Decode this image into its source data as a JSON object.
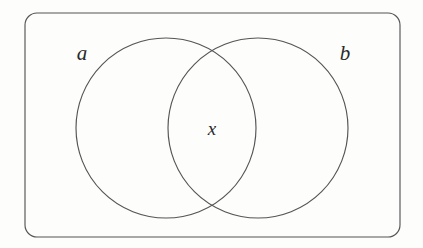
{
  "diagram": {
    "type": "venn-diagram",
    "title": "",
    "universe": {
      "name": "universal-set-rectangle",
      "label": "",
      "x": 25,
      "y": 13,
      "width": 375,
      "height": 224,
      "corner_radius": 12,
      "stroke_color": "#555555",
      "fill_color": "none"
    },
    "sets": [
      {
        "id": "a",
        "label": "a",
        "label_x": 82,
        "label_y": 60,
        "center_x": 166,
        "center_y": 128,
        "radius": 90,
        "stroke_color": "#555555",
        "fill_color": "none"
      },
      {
        "id": "b",
        "label": "b",
        "label_x": 339,
        "label_y": 60,
        "center_x": 258,
        "center_y": 128,
        "radius": 90,
        "stroke_color": "#555555",
        "fill_color": "none"
      }
    ],
    "elements": [
      {
        "id": "x",
        "label": "x",
        "region": "intersection",
        "x": 205,
        "y": 135
      }
    ],
    "background_color": "#fdfdfc",
    "stroke_color": "#555555",
    "text_color": "#2a2a2a"
  }
}
